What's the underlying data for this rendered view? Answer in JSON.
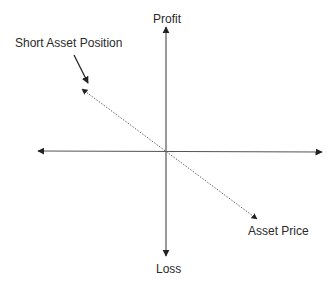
{
  "diagram": {
    "type": "payoff-diagram",
    "labels": {
      "y_positive": "Profit",
      "y_negative": "Loss",
      "x_positive": "Asset Price",
      "line_annotation": "Short Asset Position"
    },
    "colors": {
      "axis": "#444444",
      "payoff_line": "#555555",
      "text": "#2a2a2a",
      "background": "#ffffff"
    },
    "line_style": "dotted",
    "payoff_slope": "negative"
  }
}
